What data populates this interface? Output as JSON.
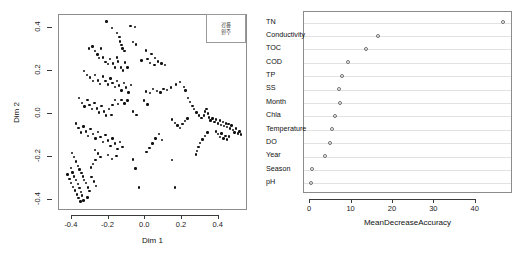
{
  "figure": {
    "width": 528,
    "height": 262,
    "background": "#ffffff",
    "point_color": "#111111",
    "frame_color": "#8c8c8c",
    "grid_color": "#e2e2e2"
  },
  "chart_data": [
    {
      "type": "scatter",
      "panel": "left",
      "title": "",
      "xlabel": "Dim 1",
      "ylabel": "Dim 2",
      "xlim": [
        -0.47,
        0.56
      ],
      "ylim": [
        -0.45,
        0.46
      ],
      "xticks": [
        -0.4,
        -0.2,
        0.0,
        0.2,
        0.4
      ],
      "xticklabels": [
        "-0.4",
        "-0.2",
        "0.0",
        "0.2",
        "0.4"
      ],
      "yticks": [
        -0.4,
        -0.2,
        0.0,
        0.2,
        0.4
      ],
      "yticklabels": [
        "-0.4",
        "-0.2",
        "0.0",
        "0.2",
        "0.4"
      ],
      "grid": false,
      "legend": {
        "position": "top-right",
        "entries": [
          "강릉",
          "원주"
        ]
      },
      "points": [
        [
          -0.205,
          0.425
        ],
        [
          -0.175,
          0.395
        ],
        [
          -0.148,
          0.372
        ],
        [
          -0.135,
          0.352
        ],
        [
          -0.132,
          0.333
        ],
        [
          -0.125,
          0.315
        ],
        [
          -0.118,
          0.3
        ],
        [
          -0.108,
          0.288
        ],
        [
          -0.075,
          0.405
        ],
        [
          -0.052,
          0.4
        ],
        [
          -0.06,
          0.33
        ],
        [
          -0.046,
          0.318
        ],
        [
          -0.3,
          0.3
        ],
        [
          -0.282,
          0.31
        ],
        [
          -0.268,
          0.288
        ],
        [
          -0.255,
          0.272
        ],
        [
          -0.248,
          0.255
        ],
        [
          -0.236,
          0.3
        ],
        [
          -0.225,
          0.258
        ],
        [
          -0.212,
          0.238
        ],
        [
          -0.198,
          0.228
        ],
        [
          -0.188,
          0.252
        ],
        [
          -0.17,
          0.23
        ],
        [
          -0.16,
          0.212
        ],
        [
          -0.15,
          0.258
        ],
        [
          -0.142,
          0.24
        ],
        [
          -0.128,
          0.212
        ],
        [
          -0.115,
          0.198
        ],
        [
          -0.105,
          0.235
        ],
        [
          -0.092,
          0.212
        ],
        [
          0.01,
          0.29
        ],
        [
          0.04,
          0.275
        ],
        [
          0.06,
          0.255
        ],
        [
          0.075,
          0.24
        ],
        [
          0.095,
          0.23
        ],
        [
          0.112,
          0.222
        ],
        [
          0.03,
          0.232
        ],
        [
          0.055,
          0.222
        ],
        [
          0.018,
          0.25
        ],
        [
          -0.015,
          0.245
        ],
        [
          -0.33,
          0.195
        ],
        [
          -0.312,
          0.178
        ],
        [
          -0.295,
          0.165
        ],
        [
          -0.28,
          0.15
        ],
        [
          -0.268,
          0.178
        ],
        [
          -0.252,
          0.152
        ],
        [
          -0.24,
          0.135
        ],
        [
          -0.225,
          0.17
        ],
        [
          -0.212,
          0.148
        ],
        [
          -0.198,
          0.132
        ],
        [
          -0.185,
          0.16
        ],
        [
          -0.172,
          0.14
        ],
        [
          -0.16,
          0.122
        ],
        [
          -0.148,
          0.15
        ],
        [
          -0.138,
          0.128
        ],
        [
          -0.125,
          0.105
        ],
        [
          -0.112,
          0.14
        ],
        [
          -0.098,
          0.118
        ],
        [
          -0.085,
          0.095
        ],
        [
          -0.072,
          0.13
        ],
        [
          0.008,
          0.1
        ],
        [
          0.03,
          0.092
        ],
        [
          0.048,
          0.112
        ],
        [
          0.068,
          0.102
        ],
        [
          0.088,
          0.095
        ],
        [
          0.105,
          0.112
        ],
        [
          0.125,
          0.108
        ],
        [
          0.145,
          0.118
        ],
        [
          0.172,
          0.132
        ],
        [
          0.195,
          0.145
        ],
        [
          0.215,
          0.122
        ],
        [
          0.225,
          0.105
        ],
        [
          -0.355,
          0.07
        ],
        [
          -0.34,
          0.048
        ],
        [
          -0.325,
          0.03
        ],
        [
          -0.31,
          0.062
        ],
        [
          -0.298,
          0.038
        ],
        [
          -0.285,
          0.018
        ],
        [
          -0.272,
          0.048
        ],
        [
          -0.258,
          0.022
        ],
        [
          -0.245,
          0.002
        ],
        [
          -0.232,
          0.032
        ],
        [
          -0.22,
          0.008
        ],
        [
          -0.208,
          -0.012
        ],
        [
          -0.192,
          0.018
        ],
        [
          -0.178,
          -0.008
        ],
        [
          -0.062,
          0.008
        ],
        [
          -0.042,
          -0.01
        ],
        [
          0.238,
          0.07
        ],
        [
          0.25,
          0.052
        ],
        [
          0.262,
          0.032
        ],
        [
          0.272,
          0.018
        ],
        [
          0.285,
          0.002
        ],
        [
          0.298,
          -0.012
        ],
        [
          0.312,
          -0.022
        ],
        [
          0.325,
          -0.012
        ],
        [
          0.332,
          0.008
        ],
        [
          0.34,
          0.02
        ],
        [
          0.348,
          -0.002
        ],
        [
          0.352,
          -0.02
        ],
        [
          0.36,
          -0.035
        ],
        [
          0.372,
          -0.025
        ],
        [
          0.382,
          -0.042
        ],
        [
          0.392,
          -0.03
        ],
        [
          0.402,
          -0.048
        ],
        [
          0.412,
          -0.035
        ],
        [
          0.418,
          -0.055
        ],
        [
          0.428,
          -0.042
        ],
        [
          0.436,
          -0.06
        ],
        [
          0.444,
          -0.048
        ],
        [
          0.452,
          -0.065
        ],
        [
          0.46,
          -0.052
        ],
        [
          0.468,
          -0.072
        ],
        [
          0.476,
          -0.058
        ],
        [
          0.484,
          -0.078
        ],
        [
          0.492,
          -0.09
        ],
        [
          0.5,
          -0.072
        ],
        [
          0.51,
          -0.095
        ],
        [
          0.52,
          -0.085
        ],
        [
          0.528,
          -0.1
        ],
        [
          0.392,
          -0.085
        ],
        [
          0.402,
          -0.098
        ],
        [
          0.412,
          -0.11
        ],
        [
          0.422,
          -0.095
        ],
        [
          0.432,
          -0.118
        ],
        [
          0.442,
          -0.105
        ],
        [
          0.452,
          -0.122
        ],
        [
          0.462,
          -0.108
        ],
        [
          0.345,
          -0.09
        ],
        [
          0.33,
          -0.105
        ],
        [
          0.318,
          -0.122
        ],
        [
          0.305,
          -0.14
        ],
        [
          0.296,
          -0.158
        ],
        [
          0.288,
          -0.175
        ],
        [
          0.282,
          -0.192
        ],
        [
          -0.372,
          -0.048
        ],
        [
          -0.358,
          -0.07
        ],
        [
          -0.345,
          -0.09
        ],
        [
          -0.332,
          -0.062
        ],
        [
          -0.318,
          -0.085
        ],
        [
          -0.305,
          -0.105
        ],
        [
          -0.292,
          -0.075
        ],
        [
          -0.278,
          -0.098
        ],
        [
          -0.265,
          -0.118
        ],
        [
          -0.252,
          -0.088
        ],
        [
          -0.238,
          -0.112
        ],
        [
          -0.225,
          -0.135
        ],
        [
          -0.212,
          -0.102
        ],
        [
          -0.198,
          -0.128
        ],
        [
          -0.185,
          -0.152
        ],
        [
          -0.172,
          -0.118
        ],
        [
          -0.158,
          -0.142
        ],
        [
          -0.145,
          -0.168
        ],
        [
          -0.132,
          -0.135
        ],
        [
          -0.118,
          -0.158
        ],
        [
          -0.198,
          -0.195
        ],
        [
          -0.175,
          -0.212
        ],
        [
          -0.152,
          -0.198
        ],
        [
          -0.395,
          -0.185
        ],
        [
          -0.382,
          -0.205
        ],
        [
          -0.372,
          -0.225
        ],
        [
          -0.362,
          -0.245
        ],
        [
          -0.352,
          -0.262
        ],
        [
          -0.342,
          -0.278
        ],
        [
          -0.335,
          -0.295
        ],
        [
          -0.328,
          -0.312
        ],
        [
          -0.4,
          -0.255
        ],
        [
          -0.39,
          -0.275
        ],
        [
          -0.382,
          -0.295
        ],
        [
          -0.372,
          -0.312
        ],
        [
          -0.362,
          -0.33
        ],
        [
          -0.352,
          -0.348
        ],
        [
          -0.345,
          -0.365
        ],
        [
          -0.338,
          -0.382
        ],
        [
          -0.418,
          -0.285
        ],
        [
          -0.408,
          -0.305
        ],
        [
          -0.398,
          -0.325
        ],
        [
          -0.388,
          -0.342
        ],
        [
          -0.378,
          -0.36
        ],
        [
          -0.368,
          -0.378
        ],
        [
          -0.358,
          -0.395
        ],
        [
          -0.348,
          -0.41
        ],
        [
          -0.318,
          -0.325
        ],
        [
          -0.308,
          -0.345
        ],
        [
          -0.298,
          -0.362
        ],
        [
          -0.288,
          -0.298
        ],
        [
          -0.275,
          -0.318
        ],
        [
          -0.262,
          -0.338
        ],
        [
          -0.332,
          -0.405
        ],
        [
          -0.31,
          -0.392
        ],
        [
          -0.29,
          -0.252
        ],
        [
          -0.278,
          -0.235
        ],
        [
          -0.265,
          -0.218
        ],
        [
          -0.06,
          -0.215
        ],
        [
          -0.048,
          -0.258
        ],
        [
          -0.028,
          -0.345
        ],
        [
          0.152,
          -0.218
        ],
        [
          0.168,
          -0.345
        ],
        [
          0.098,
          -0.125
        ],
        [
          0.082,
          -0.098
        ],
        [
          0.062,
          -0.118
        ],
        [
          0.045,
          -0.142
        ],
        [
          0.028,
          -0.162
        ],
        [
          0.012,
          -0.182
        ],
        [
          0.152,
          -0.03
        ],
        [
          0.168,
          -0.045
        ],
        [
          0.182,
          -0.058
        ],
        [
          0.196,
          -0.07
        ],
        [
          0.208,
          -0.052
        ],
        [
          0.222,
          -0.038
        ],
        [
          0.235,
          -0.025
        ],
        [
          -0.268,
          -0.172
        ],
        [
          -0.252,
          -0.188
        ],
        [
          -0.238,
          -0.205
        ],
        [
          -0.092,
          0.058
        ],
        [
          -0.108,
          0.045
        ],
        [
          -0.125,
          0.062
        ],
        [
          -0.142,
          0.042
        ],
        [
          -0.158,
          0.06
        ],
        [
          -0.172,
          0.038
        ],
        [
          0.0,
          0.058
        ],
        [
          0.018,
          0.04
        ]
      ]
    },
    {
      "type": "dotchart",
      "panel": "right",
      "title": "",
      "xlabel": "MeanDecreaseAccuracy",
      "ylabel": "",
      "xlim": [
        -1.5,
        49
      ],
      "xticks": [
        0,
        10,
        20,
        30,
        40
      ],
      "xticklabels": [
        "0",
        "10",
        "20",
        "30",
        "40"
      ],
      "grid": true,
      "grid_orientation": "horizontal",
      "categories": [
        "TN",
        "Conductivity",
        "TOC",
        "COD",
        "TP",
        "SS",
        "Month",
        "Chla",
        "Temperature",
        "DO",
        "Year",
        "Season",
        "pH"
      ],
      "values": [
        46.6,
        16.4,
        13.6,
        9.3,
        7.7,
        7.0,
        7.4,
        6.1,
        5.4,
        4.9,
        3.8,
        0.5,
        0.3
      ]
    }
  ],
  "left_panel": {
    "xlabel": "Dim 1",
    "ylabel": "Dim 2",
    "legend_line1": "강릉",
    "legend_line2": "원주"
  },
  "right_panel": {
    "xlabel": "MeanDecreaseAccuracy"
  }
}
